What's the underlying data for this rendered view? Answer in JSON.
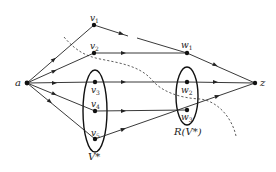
{
  "diagram": {
    "type": "directed flow network",
    "nodes": [
      {
        "id": "a",
        "label": "a",
        "x": 27,
        "y": 83
      },
      {
        "id": "v1",
        "label": "v",
        "sub": "1",
        "x": 94,
        "y": 25
      },
      {
        "id": "v2",
        "label": "v",
        "sub": "2",
        "x": 94,
        "y": 53
      },
      {
        "id": "v3",
        "label": "v",
        "sub": "3",
        "x": 95,
        "y": 82
      },
      {
        "id": "v4",
        "label": "v",
        "sub": "4",
        "x": 95,
        "y": 111
      },
      {
        "id": "v5",
        "label": "v",
        "sub": "5",
        "x": 95,
        "y": 139
      },
      {
        "id": "w1",
        "label": "w",
        "sub": "1",
        "x": 187,
        "y": 53
      },
      {
        "id": "w2",
        "label": "w",
        "sub": "2",
        "x": 187,
        "y": 82
      },
      {
        "id": "w3",
        "label": "w",
        "sub": "3",
        "x": 187,
        "y": 110
      },
      {
        "id": "z",
        "label": "z",
        "x": 255,
        "y": 83
      }
    ],
    "edges": [
      {
        "from": "a",
        "to": "v1"
      },
      {
        "from": "a",
        "to": "v2"
      },
      {
        "from": "a",
        "to": "v3"
      },
      {
        "from": "a",
        "to": "v4"
      },
      {
        "from": "a",
        "to": "v5"
      },
      {
        "from": "v1",
        "to": "w1",
        "broken": true
      },
      {
        "from": "v2",
        "to": "w1"
      },
      {
        "from": "v3",
        "to": "w2"
      },
      {
        "from": "v4",
        "to": "w3"
      },
      {
        "from": "v5",
        "to": "z"
      },
      {
        "from": "w1",
        "to": "z"
      },
      {
        "from": "w2",
        "to": "z"
      }
    ],
    "sets": [
      {
        "id": "V-star",
        "label": "V*",
        "contains": [
          "v3",
          "v4",
          "v5"
        ]
      },
      {
        "id": "R-V-star",
        "label": "R(V*)",
        "contains": [
          "w2",
          "w3"
        ]
      }
    ],
    "cut_curve": {
      "style": "dashed"
    }
  }
}
